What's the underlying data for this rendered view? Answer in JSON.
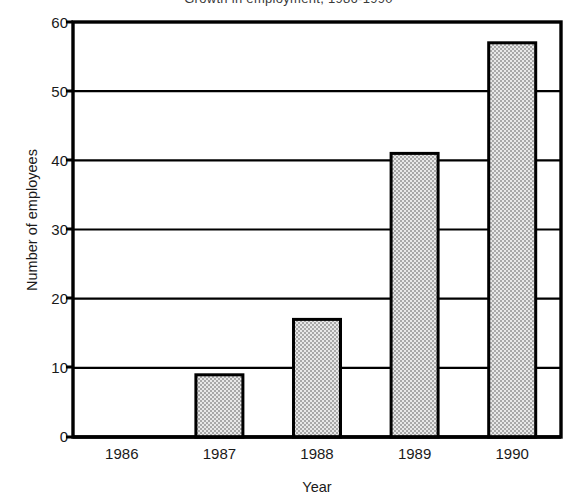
{
  "figure": {
    "title_fragment": "Growth in employment, 1986-1990",
    "background_color": "#ffffff",
    "line_color": "#000000",
    "bar_fill_color": "#d0d0d0",
    "bar_edge_color": "#000000"
  },
  "chart_data": {
    "type": "bar",
    "title": "Growth in employment, 1986-1990",
    "xlabel": "Year",
    "ylabel": "Number of employees",
    "categories": [
      "1986",
      "1987",
      "1988",
      "1989",
      "1990"
    ],
    "values": [
      5,
      9,
      17,
      41,
      57
    ],
    "ylim": [
      0,
      60
    ],
    "yticks": [
      0,
      10,
      20,
      30,
      40,
      50,
      60
    ],
    "ytick_labels": [
      "0",
      "10",
      "20",
      "30",
      "40",
      "50",
      "60"
    ],
    "grid": "horizontal",
    "legend": "none",
    "series": [
      {
        "name": "Number of employees",
        "values": [
          5,
          9,
          17,
          41,
          57
        ]
      }
    ]
  },
  "axis": {
    "y_labels": [
      "60",
      "50",
      "40",
      "30",
      "20",
      "10",
      "0"
    ],
    "x_labels": [
      "1986",
      "1987",
      "1988",
      "1989",
      "1990"
    ]
  }
}
